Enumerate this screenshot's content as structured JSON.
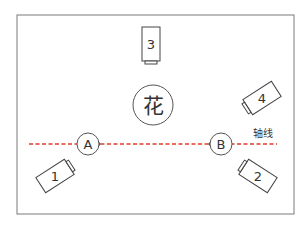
{
  "diagram": {
    "subject": {
      "label": "花"
    },
    "axis": {
      "label": "轴线",
      "color": "#e8553a"
    },
    "positions": [
      {
        "id": "A",
        "label": "A"
      },
      {
        "id": "B",
        "label": "B"
      }
    ],
    "cameras": [
      {
        "id": "1",
        "label": "1"
      },
      {
        "id": "2",
        "label": "2"
      },
      {
        "id": "3",
        "label": "3"
      },
      {
        "id": "4",
        "label": "4"
      }
    ],
    "colors": {
      "frame": "#777777",
      "stroke": "#444444",
      "axis_line": "#e03c28",
      "axis_text": "#f08a6a"
    }
  }
}
